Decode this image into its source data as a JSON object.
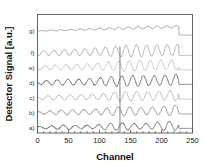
{
  "chart_data": {
    "type": "line",
    "title": "",
    "xlabel": "Channel",
    "ylabel": "Detector Signal [a.u.]",
    "xlim": [
      0,
      250
    ],
    "ylim": [
      0,
      7.6
    ],
    "grid": false,
    "legend_position": "inline-left",
    "xticks": [
      0,
      50,
      100,
      150,
      200,
      250
    ],
    "xtick_labels": [
      "0",
      "50",
      "100",
      "150",
      "200",
      "250"
    ],
    "yticks": [],
    "ytick_labels": [],
    "annotations": [
      {
        "name": "spike-marker",
        "x": 133,
        "text": ""
      }
    ],
    "series": [
      {
        "name": "a)",
        "label": "a)",
        "color": "#3a3a3a",
        "offset": 0.35,
        "amplitude": 0.3,
        "period": 19.0,
        "phase": 0.35,
        "ramp": 0.12,
        "beat_period": 86.0,
        "beat_depth": 0.42,
        "noise": 0.035,
        "cutoff": 228,
        "tail_level": 0.3
      },
      {
        "name": "b)",
        "label": "b)",
        "color": "#6a6a6a",
        "offset": 1.3,
        "amplitude": 0.34,
        "period": 18.4,
        "phase": 1.1,
        "ramp": 0.16,
        "beat_period": 94.0,
        "beat_depth": 0.3,
        "noise": 0.03,
        "cutoff": 228,
        "tail_level": 1.22
      },
      {
        "name": "c)",
        "label": "c)",
        "color": "#9a9a9a",
        "offset": 2.25,
        "amplitude": 0.36,
        "period": 17.9,
        "phase": 2.0,
        "ramp": 0.18,
        "beat_period": 102.0,
        "beat_depth": 0.26,
        "noise": 0.028,
        "cutoff": 228,
        "tail_level": 2.18
      },
      {
        "name": "d)",
        "label": "d)",
        "color": "#2e2e2e",
        "offset": 3.22,
        "amplitude": 0.4,
        "period": 17.4,
        "phase": 2.7,
        "ramp": 0.2,
        "beat_period": 110.0,
        "beat_depth": 0.22,
        "noise": 0.03,
        "cutoff": 228,
        "tail_level": 3.12
      },
      {
        "name": "e)",
        "label": "e)",
        "color": "#b0b0b0",
        "offset": 4.18,
        "amplitude": 0.38,
        "period": 17.0,
        "phase": 3.4,
        "ramp": 0.22,
        "beat_period": 118.0,
        "beat_depth": 0.2,
        "noise": 0.032,
        "cutoff": 228,
        "tail_level": 4.05
      },
      {
        "name": "f)",
        "label": "f)",
        "color": "#8d8d8d",
        "offset": 5.12,
        "amplitude": 0.42,
        "period": 16.6,
        "phase": 4.1,
        "ramp": 0.24,
        "beat_period": 126.0,
        "beat_depth": 0.18,
        "noise": 0.03,
        "cutoff": 228,
        "tail_level": 4.98
      },
      {
        "name": "g)",
        "label": "g)",
        "color": "#7d7d7d",
        "offset": 6.55,
        "amplitude": 0.085,
        "period": 15.5,
        "phase": 5.0,
        "ramp": 0.3,
        "beat_period": 140.0,
        "beat_depth": 0.1,
        "noise": 0.022,
        "cutoff": 228,
        "tail_level": 6.28
      }
    ]
  }
}
